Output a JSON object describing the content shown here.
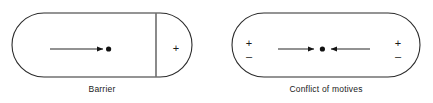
{
  "canvas": {
    "width": 433,
    "height": 103,
    "background": "#ffffff"
  },
  "style": {
    "stroke_color": "#2b2b2b",
    "stroke_width": 1,
    "text_color": "#1a1a1a",
    "dot_color": "#111111"
  },
  "figures": [
    {
      "id": "barrier",
      "caption": "Barrier",
      "shape": "stadium",
      "region_sign": "+",
      "divider": "vertical-barrier-line",
      "arrows": [
        {
          "id": "approach-arrow",
          "direction": "right",
          "from_x": 50,
          "to_x": 104,
          "y": 49
        }
      ],
      "person_dot": {
        "x": 108,
        "y": 49
      }
    },
    {
      "id": "conflict-of-motives",
      "caption": "Conflict of motives",
      "shape": "stadium",
      "left_signs": [
        "+",
        "–"
      ],
      "right_signs": [
        "+",
        "–"
      ],
      "arrows": [
        {
          "id": "left-approach-arrow",
          "direction": "right",
          "from_x": 278,
          "to_x": 315,
          "y": 49
        },
        {
          "id": "right-approach-arrow",
          "direction": "left",
          "from_x": 370,
          "to_x": 330,
          "y": 49
        }
      ],
      "person_dot": {
        "x": 322,
        "y": 49
      }
    }
  ],
  "signs": {
    "plus": "+",
    "minus": "–"
  }
}
